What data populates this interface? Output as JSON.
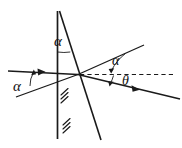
{
  "figure": {
    "kind": "optics-refraction-diagram",
    "width": 182,
    "height": 148,
    "background_color": "#ffffff",
    "line_color": "#1a1a1a",
    "labels": {
      "alpha_top": "α",
      "alpha_left": "α",
      "alpha_right": "α",
      "theta": "θ"
    },
    "elements": {
      "normal_line_name": "vertical-normal-line",
      "surface_line_name": "slanted-interface-line",
      "incident_ray_name": "incident-ray",
      "reflected_ray_name": "upward-slanted-ray",
      "refracted_ray_name": "refracted-ray",
      "dashed_axis_name": "dashed-horizontal-axis",
      "hatching_name": "medium-hatching"
    }
  }
}
